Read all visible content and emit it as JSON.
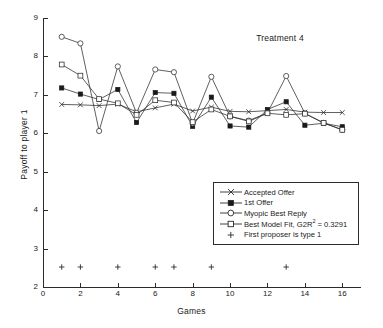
{
  "chart_data": {
    "type": "line",
    "title": "Treatment 4",
    "xlabel": "Games",
    "ylabel": "Payoff to player 1",
    "xlim": [
      0,
      17
    ],
    "ylim": [
      2,
      9
    ],
    "xticks": [
      0,
      2,
      4,
      6,
      8,
      10,
      12,
      14,
      16
    ],
    "yticks": [
      2,
      3,
      4,
      5,
      6,
      7,
      8,
      9
    ],
    "grid": false,
    "legend_position": "lower-right inside axes",
    "x": [
      1,
      2,
      3,
      4,
      5,
      6,
      7,
      8,
      9,
      10,
      11,
      12,
      13,
      14,
      15,
      16
    ],
    "series": [
      {
        "name": "Accepted Offer",
        "marker": "x",
        "values": [
          6.75,
          6.74,
          6.72,
          6.76,
          6.56,
          6.66,
          6.76,
          6.58,
          6.68,
          6.57,
          6.56,
          6.59,
          6.62,
          6.55,
          6.54,
          6.54
        ]
      },
      {
        "name": "1st Offer",
        "marker": "filled-square",
        "values": [
          7.18,
          7.02,
          6.88,
          7.14,
          6.28,
          7.06,
          7.04,
          6.18,
          6.94,
          6.19,
          6.16,
          6.62,
          6.82,
          6.21,
          6.26,
          6.17
        ]
      },
      {
        "name": "Myopic Best Reply",
        "marker": "open-circle",
        "values": [
          8.51,
          8.34,
          6.06,
          7.74,
          6.53,
          7.66,
          7.59,
          6.26,
          7.47,
          6.44,
          6.33,
          6.53,
          7.49,
          6.52,
          6.27,
          6.09
        ]
      },
      {
        "name": "Best Model Fit, G2R² = 0.3291",
        "marker": "open-square",
        "values": [
          7.79,
          7.5,
          6.89,
          6.78,
          6.48,
          6.86,
          6.8,
          6.29,
          6.62,
          6.44,
          6.31,
          6.52,
          6.48,
          6.51,
          6.27,
          6.09
        ]
      }
    ],
    "type_markers": {
      "name": "First proposer is type 1",
      "marker": "plus",
      "y": 2.52,
      "games": [
        1,
        2,
        4,
        6,
        7,
        9,
        13
      ]
    },
    "legend_entries": [
      "Accepted Offer",
      "1st Offer",
      "Myopic Best Reply",
      "Best Model Fit, G2R2 = 0.3291",
      "First proposer is type 1"
    ]
  },
  "legend": {
    "items": [
      {
        "label": "Accepted Offer",
        "glyph": "line-x-marker"
      },
      {
        "label": "1st Offer",
        "glyph": "line-filled-square-marker"
      },
      {
        "label": "Myopic Best Reply",
        "glyph": "line-open-circle-marker"
      },
      {
        "label_prefix": "Best Model Fit, G2R",
        "label_sup": "2",
        "label_suffix": " = 0.3291",
        "glyph": "line-open-square-marker"
      },
      {
        "label": "First proposer is type 1",
        "glyph": "plus-marker"
      }
    ]
  },
  "axes": {
    "title": "Treatment 4",
    "x_label": "Games",
    "y_label": "Payoff to player 1",
    "x_tick_labels": [
      "0",
      "2",
      "4",
      "6",
      "8",
      "10",
      "12",
      "14",
      "16"
    ],
    "y_tick_labels": [
      "2",
      "3",
      "4",
      "5",
      "6",
      "7",
      "8",
      "9"
    ]
  },
  "style": {
    "ink": "#2b2b2b",
    "background": "#ffffff"
  }
}
